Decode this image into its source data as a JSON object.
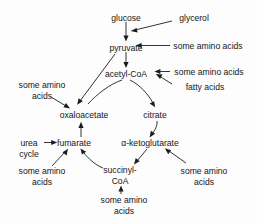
{
  "diagram": {
    "type": "flow-diagram",
    "stroke_color": "#1d1d1d",
    "text_color": "#161616",
    "background_color": "#fdfdfd",
    "nodes": [
      {
        "id": "glucose",
        "label": "glucose",
        "x": 126,
        "y": 18
      },
      {
        "id": "glycerol",
        "label": "glycerol",
        "x": 194,
        "y": 18
      },
      {
        "id": "pyruvate",
        "label": "pyruvate",
        "x": 126,
        "y": 48
      },
      {
        "id": "aa_pyruvate",
        "label": "some amino acids",
        "x": 208,
        "y": 48
      },
      {
        "id": "acetyl_coa",
        "label": "acetyl-CoA",
        "x": 126,
        "y": 75
      },
      {
        "id": "aa_acetyl",
        "label": "some amino acids",
        "x": 208,
        "y": 74
      },
      {
        "id": "fatty_acids",
        "label": "fatty acids",
        "x": 205,
        "y": 87
      },
      {
        "id": "aa_oxaloacetate",
        "label_line1": "some amino",
        "label_line2": "acids",
        "x": 42,
        "y": 87
      },
      {
        "id": "oxaloacetate",
        "label": "oxaloacetate",
        "x": 84,
        "y": 117
      },
      {
        "id": "citrate",
        "label": "citrate",
        "x": 155,
        "y": 117
      },
      {
        "id": "urea_cycle",
        "label_line1": "urea",
        "label_line2": "cycle",
        "x": 29,
        "y": 145
      },
      {
        "id": "fumarate",
        "label": "fumarate",
        "x": 74,
        "y": 145
      },
      {
        "id": "ketoglutarate",
        "label": "α-ketoglutarate",
        "x": 150,
        "y": 145
      },
      {
        "id": "aa_fumarate",
        "label_line1": "some amino",
        "label_line2": "acids",
        "x": 42,
        "y": 173
      },
      {
        "id": "succinyl_coa",
        "label_line1": "succinyl-",
        "label_line2": "CoA",
        "x": 120,
        "y": 172
      },
      {
        "id": "aa_ketoglutarate",
        "label_line1": "some amino",
        "label_line2": "acids",
        "x": 204,
        "y": 173
      },
      {
        "id": "aa_succinyl",
        "label_line1": "some amino",
        "label_line2": "acids",
        "x": 124,
        "y": 202
      }
    ],
    "edges": [
      {
        "id": "glucose-to-pyruvate",
        "from": "glucose",
        "to": "pyruvate"
      },
      {
        "id": "glycerol-to-glycolysis",
        "from": "glycerol",
        "to": "glucose-pyruvate-path"
      },
      {
        "id": "aminoacids-to-pyruvate",
        "from": "aa_pyruvate",
        "to": "pyruvate"
      },
      {
        "id": "pyruvate-to-acetylcoa",
        "from": "pyruvate",
        "to": "acetyl_coa"
      },
      {
        "id": "aminoacids-to-acetylcoa",
        "from": "aa_acetyl",
        "to": "acetyl_coa"
      },
      {
        "id": "fattyacids-to-acetylcoa",
        "from": "fatty_acids",
        "to": "acetyl_coa"
      },
      {
        "id": "pyruvate-to-oxaloacetate",
        "from": "pyruvate",
        "to": "oxaloacetate"
      },
      {
        "id": "aminoacids-to-oxaloacetate",
        "from": "aa_oxaloacetate",
        "to": "oxaloacetate"
      },
      {
        "id": "acetylcoa-to-oxaloacetate",
        "from": "acetyl_coa",
        "to": "oxaloacetate"
      },
      {
        "id": "acetylcoa-to-citrate",
        "from": "acetyl_coa",
        "to": "citrate"
      },
      {
        "id": "citrate-to-ketoglutarate",
        "from": "citrate",
        "to": "ketoglutarate"
      },
      {
        "id": "ketoglutarate-to-succinylcoa",
        "from": "ketoglutarate",
        "to": "succinyl_coa"
      },
      {
        "id": "aminoacids-to-ketoglutarate",
        "from": "aa_ketoglutarate",
        "to": "ketoglutarate"
      },
      {
        "id": "succinylcoa-to-fumarate",
        "from": "succinyl_coa",
        "to": "fumarate"
      },
      {
        "id": "aminoacids-to-succinylcoa",
        "from": "aa_succinyl",
        "to": "succinyl_coa"
      },
      {
        "id": "fumarate-to-oxaloacetate",
        "from": "fumarate",
        "to": "oxaloacetate"
      },
      {
        "id": "ureacycle-to-fumarate",
        "from": "urea_cycle",
        "to": "fumarate"
      },
      {
        "id": "aminoacids-to-fumarate",
        "from": "aa_fumarate",
        "to": "fumarate"
      }
    ]
  }
}
